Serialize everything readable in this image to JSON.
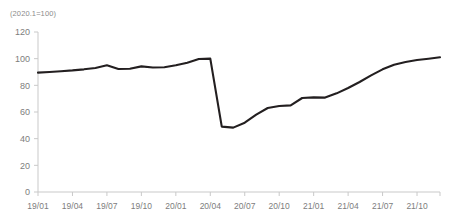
{
  "chart_data": {
    "type": "line",
    "title": "",
    "unit_note": "(2020.1=100)",
    "xlabel": "",
    "ylabel": "",
    "ylim": [
      0,
      120
    ],
    "yticks": [
      0,
      20,
      40,
      60,
      80,
      100,
      120
    ],
    "grid": false,
    "legend": "none",
    "xtick_labels": [
      "19/01",
      "19/04",
      "19/07",
      "19/10",
      "20/01",
      "20/04",
      "20/07",
      "20/10",
      "21/01",
      "21/04",
      "21/07",
      "21/10"
    ],
    "xtick_indices": [
      0,
      3,
      6,
      9,
      12,
      15,
      18,
      21,
      24,
      27,
      30,
      33
    ],
    "x": [
      "19/01",
      "19/02",
      "19/03",
      "19/04",
      "19/05",
      "19/06",
      "19/07",
      "19/08",
      "19/09",
      "19/10",
      "19/11",
      "19/12",
      "20/01",
      "20/02",
      "20/03",
      "20/04",
      "20/05",
      "20/06",
      "20/07",
      "20/08",
      "20/09",
      "20/10",
      "20/11",
      "20/12",
      "21/01",
      "21/02",
      "21/03",
      "21/04",
      "21/05",
      "21/06",
      "21/07",
      "21/08",
      "21/09",
      "21/10",
      "21/11",
      "21/12"
    ],
    "series": [
      {
        "name": "Index",
        "color": "#231f20",
        "values": [
          89.5,
          90.0,
          90.6,
          91.2,
          92.0,
          93.0,
          95.0,
          92.2,
          92.4,
          94.2,
          93.4,
          93.6,
          95.0,
          97.0,
          99.8,
          100.0,
          49.0,
          48.3,
          52.0,
          58.0,
          63.0,
          64.5,
          65.0,
          70.5,
          71.0,
          70.8,
          74.0,
          78.0,
          82.5,
          87.5,
          92.0,
          95.5,
          97.5,
          99.0,
          100.0,
          101.0
        ]
      }
    ]
  },
  "axes": {
    "x_color": "#c9c9c9",
    "y_color": "#c9c9c9",
    "label_color": "#7d7d7d"
  }
}
